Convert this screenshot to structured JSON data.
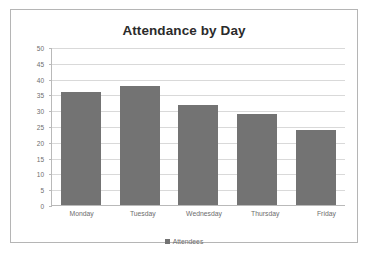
{
  "chart_data": {
    "type": "bar",
    "title": "Attendance by Day",
    "xlabel": "",
    "ylabel": "",
    "categories": [
      "Monday",
      "Tuesday",
      "Wednesday",
      "Thursday",
      "Friday"
    ],
    "values": [
      36,
      38,
      32,
      29,
      24
    ],
    "series": [
      {
        "name": "Attendees",
        "values": [
          36,
          38,
          32,
          29,
          24
        ],
        "color": "#737373"
      }
    ],
    "ylim": [
      0,
      50
    ],
    "ytick_step": 5,
    "yticks": [
      0,
      5,
      10,
      15,
      20,
      25,
      30,
      35,
      40,
      45,
      50
    ],
    "ytick_labels": [
      "0",
      "5",
      "10",
      "15",
      "20",
      "25",
      "30",
      "35",
      "40",
      "45",
      "50"
    ],
    "grid": "horizontal",
    "legend": {
      "position": "bottom",
      "entries": [
        "Attendees"
      ]
    }
  },
  "colors": {
    "bar": "#737373",
    "gridline": "#d9d9d9",
    "axis": "#b9b9b9",
    "frame": "#b5b5b5",
    "title_text": "#2b2b2b",
    "tick_text": "#6d6d6d",
    "background": "#ffffff"
  }
}
